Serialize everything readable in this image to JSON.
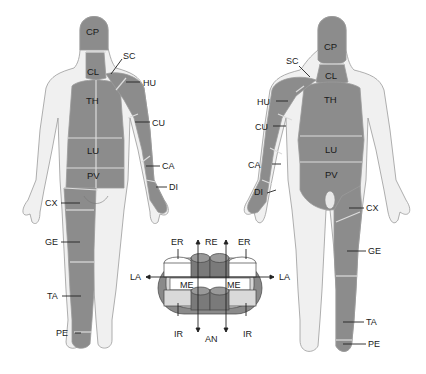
{
  "colors": {
    "dermatome": "#8c8c8c",
    "skin": "#f0f0f0",
    "outline": "#9a9a9a",
    "boundary": "#dcdcdc",
    "ring_dark": "#7a7a7a",
    "ring_mid": "#a8a8a8",
    "ring_light": "#d6d6d6",
    "text": "#1a1a1a"
  },
  "posterior_figure": {
    "region_labels": [
      "CP",
      "CL",
      "TH",
      "LU",
      "PV"
    ],
    "callouts": [
      "SC",
      "HU",
      "CU",
      "CA",
      "DI",
      "CX",
      "GE",
      "TA",
      "PE"
    ]
  },
  "anterior_figure": {
    "region_labels": [
      "CP",
      "CL",
      "TH",
      "LU",
      "PV"
    ],
    "callouts": [
      "SC",
      "HU",
      "CU",
      "CA",
      "DI",
      "CX",
      "GE",
      "TA",
      "PE"
    ]
  },
  "orientation_diagram": {
    "top_labels": [
      "ER",
      "RE",
      "ER"
    ],
    "side_labels": [
      "LA",
      "LA"
    ],
    "inner_labels": [
      "ME",
      "ME"
    ],
    "bottom_labels": [
      "IR",
      "AN",
      "IR"
    ]
  }
}
